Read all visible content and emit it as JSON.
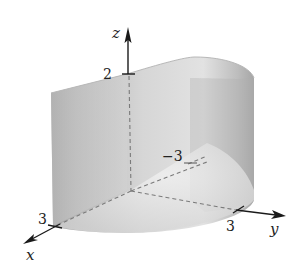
{
  "figure": {
    "axes": {
      "x": {
        "label": "x",
        "tick_label": "3"
      },
      "y": {
        "label": "y",
        "tick_label": "3",
        "neg_tick_label": "−3"
      },
      "z": {
        "label": "z",
        "tick_label": "2"
      }
    },
    "colors": {
      "surface_light": "#e6e6e6",
      "surface_mid": "#c8c8c8",
      "surface_dark": "#9a9a9a",
      "axis": "#1a1a1a",
      "dashed": "#777777"
    }
  }
}
